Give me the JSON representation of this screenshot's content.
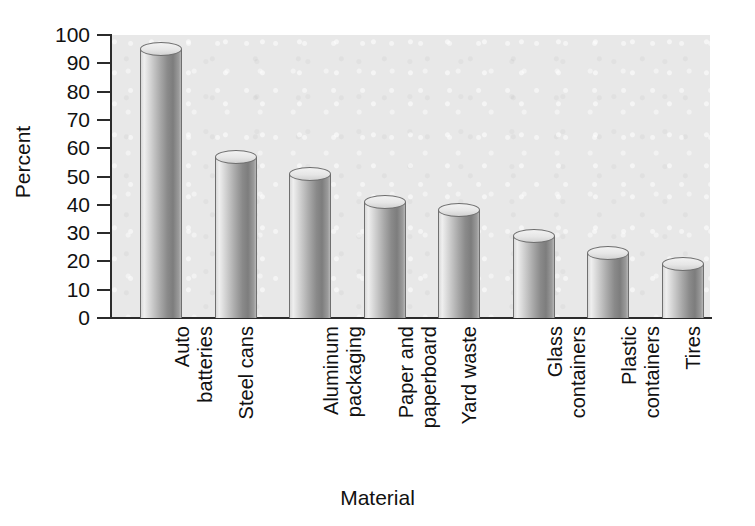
{
  "chart_data": {
    "type": "bar",
    "title": "",
    "xlabel": "Material",
    "ylabel": "Percent",
    "ylim": [
      0,
      100
    ],
    "ytick_step": 10,
    "yticks": [
      100,
      90,
      80,
      70,
      60,
      50,
      40,
      30,
      20,
      10,
      0
    ],
    "grid": false,
    "legend": null,
    "categories": [
      "Auto\nbatteries",
      "Steel cans",
      "Aluminum\npackaging",
      "Paper and\npaperboard",
      "Yard waste",
      "Glass\ncontainers",
      "Plastic\ncontainers",
      "Tires"
    ],
    "values": [
      95,
      57,
      51,
      41,
      38,
      29,
      23,
      19
    ],
    "bar_style": "3d-cylinder",
    "colors": {
      "plot_background": "#e8e8e8",
      "page_background": "#ffffff",
      "axis": "#2b2b2b",
      "bar_light": "#efefef",
      "bar_dark": "#7d7d7d",
      "text": "#111111"
    }
  }
}
